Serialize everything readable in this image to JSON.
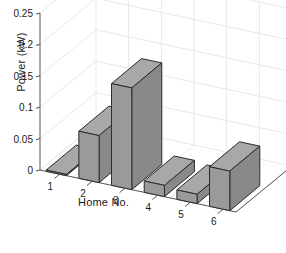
{
  "figure": {
    "background_color": "#ffffff",
    "bar_front_color": "#9a9a9a",
    "bar_top_color": "#a8a8a8",
    "bar_side_color": "#898989",
    "bar_edge_color": "#2b2b2b",
    "axis_color": "#555555",
    "grid_color": "#e8e8e8",
    "text_color": "#1a1a1a"
  },
  "chart_data": {
    "type": "bar",
    "title": "",
    "xlabel": "Home No.",
    "ylabel": "Power (kW)",
    "categories": [
      "1",
      "2",
      "3",
      "4",
      "5",
      "6"
    ],
    "values": [
      0.002,
      0.075,
      0.162,
      0.018,
      0.015,
      0.063
    ],
    "ylim": [
      0,
      0.25
    ],
    "yticks": [
      0,
      0.05,
      0.1,
      0.15,
      0.2,
      0.25
    ],
    "ytick_labels": [
      "0",
      "0.05",
      "0.1",
      "0.15",
      "0.2",
      "0.25"
    ],
    "xtick_labels": [
      "1",
      "2",
      "3",
      "4",
      "5",
      "6"
    ],
    "grid": true,
    "legend": null,
    "projection": "3d",
    "series": [
      {
        "name": "Power",
        "values": [
          0.002,
          0.075,
          0.162,
          0.018,
          0.015,
          0.063
        ]
      }
    ]
  }
}
